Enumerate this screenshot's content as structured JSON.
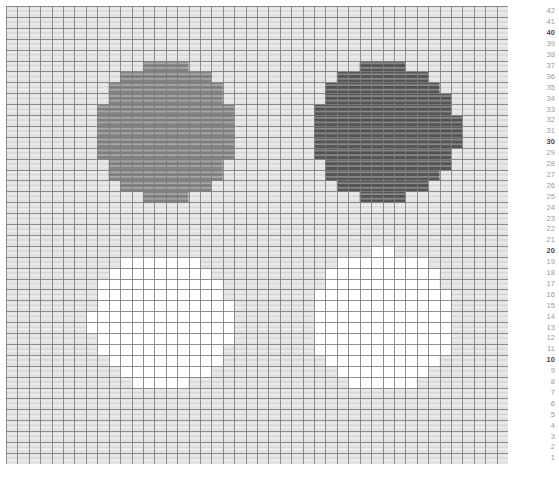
{
  "view": {
    "title": "Pixelated grid heatmap",
    "background_color": "#ffffff"
  },
  "grid": {
    "columns": 44,
    "rows": 42,
    "cell_width": 11.41,
    "cell_height": 10.9,
    "origin_x": 6,
    "origin_y": 6,
    "gridline_color": "#7d7d7d",
    "gridline_width": 1,
    "background_cell_color": "#e2e2e2",
    "texture": "horizontal-banding",
    "texture_color": "#f2f2f2"
  },
  "palette": {
    "background": "#e2e2e2",
    "mid_gray": "#828282",
    "dark_gray": "#555555",
    "white": "#ffffff",
    "gridline": "#7d7d7d",
    "label_normal": "#9a9a9a",
    "label_major": "#4a4a4a"
  },
  "blobs": [
    {
      "name": "top-left-blob",
      "fill": "#828282",
      "center_col": 14.0,
      "center_row": 30.5,
      "radius_cols": 6.2,
      "radius_rows": 6.2
    },
    {
      "name": "top-right-blob",
      "fill": "#555555",
      "center_col": 33.2,
      "center_row": 30.5,
      "radius_cols": 6.4,
      "radius_rows": 6.4
    },
    {
      "name": "bottom-left-blob",
      "fill": "#ffffff",
      "center_col": 13.6,
      "center_row": 13.2,
      "radius_cols": 6.2,
      "radius_rows": 6.2
    },
    {
      "name": "bottom-right-blob",
      "fill": "#ffffff",
      "center_col": 33.0,
      "center_row": 13.2,
      "radius_cols": 6.4,
      "radius_rows": 6.4
    }
  ],
  "row_axis": {
    "orientation": "right",
    "major_step": 10,
    "labels": [
      {
        "value": "42",
        "major": false
      },
      {
        "value": "41",
        "major": false
      },
      {
        "value": "40",
        "major": true
      },
      {
        "value": "39",
        "major": false
      },
      {
        "value": "38",
        "major": false
      },
      {
        "value": "37",
        "major": false
      },
      {
        "value": "36",
        "major": false
      },
      {
        "value": "35",
        "major": false
      },
      {
        "value": "34",
        "major": false
      },
      {
        "value": "33",
        "major": false
      },
      {
        "value": "32",
        "major": false
      },
      {
        "value": "31",
        "major": false
      },
      {
        "value": "30",
        "major": true
      },
      {
        "value": "29",
        "major": false
      },
      {
        "value": "28",
        "major": false
      },
      {
        "value": "27",
        "major": false
      },
      {
        "value": "26",
        "major": false
      },
      {
        "value": "25",
        "major": false
      },
      {
        "value": "24",
        "major": false
      },
      {
        "value": "23",
        "major": false
      },
      {
        "value": "22",
        "major": false
      },
      {
        "value": "21",
        "major": false
      },
      {
        "value": "20",
        "major": true
      },
      {
        "value": "19",
        "major": false
      },
      {
        "value": "18",
        "major": false
      },
      {
        "value": "17",
        "major": false
      },
      {
        "value": "16",
        "major": false
      },
      {
        "value": "15",
        "major": false
      },
      {
        "value": "14",
        "major": false
      },
      {
        "value": "13",
        "major": false
      },
      {
        "value": "12",
        "major": false
      },
      {
        "value": "11",
        "major": false
      },
      {
        "value": "10",
        "major": true
      },
      {
        "value": "9",
        "major": false
      },
      {
        "value": "8",
        "major": false
      },
      {
        "value": "7",
        "major": false
      },
      {
        "value": "6",
        "major": false
      },
      {
        "value": "5",
        "major": false
      },
      {
        "value": "4",
        "major": false
      },
      {
        "value": "3",
        "major": false
      },
      {
        "value": "2",
        "major": false
      },
      {
        "value": "1",
        "major": false
      }
    ]
  }
}
